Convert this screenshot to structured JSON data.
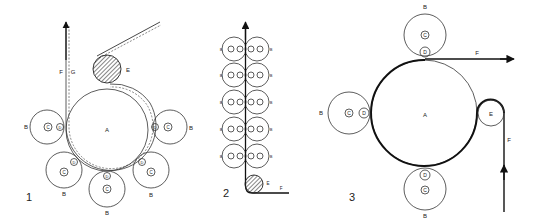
{
  "figure": {
    "colors": {
      "stroke": "#222222",
      "background": "#ffffff",
      "hatch": "#333333"
    },
    "diagrams": [
      {
        "number": "1",
        "labels": {
          "A": "A",
          "B": "B",
          "C": "C",
          "D": "D",
          "E": "E",
          "F": "F",
          "G": "G"
        }
      },
      {
        "number": "2",
        "labels": {
          "B": "B",
          "E": "E",
          "F": "F"
        },
        "roller_pairs": 5
      },
      {
        "number": "3",
        "labels": {
          "A": "A",
          "B": "B",
          "C": "C",
          "D": "D",
          "E": "E",
          "F_out": "F",
          "F_in": "F"
        }
      }
    ]
  }
}
